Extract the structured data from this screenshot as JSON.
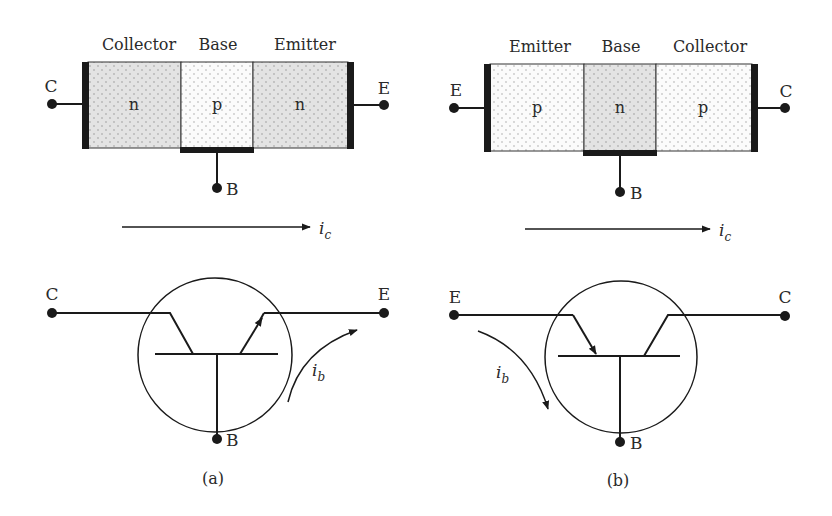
{
  "figure": {
    "colors": {
      "ink": "#1a1a1a",
      "n_region_fill": "#e3e3e3",
      "p_region_fill": "#fbfbfb",
      "dot_pattern": "#8a8a8a"
    },
    "panels": [
      {
        "id": "a",
        "caption": "(a)",
        "type": "npn",
        "region_headers": [
          "Collector",
          "Base",
          "Emitter"
        ],
        "region_types": [
          "n",
          "p",
          "n"
        ],
        "terminals": {
          "left": "C",
          "right": "E",
          "bottom": "B"
        },
        "collector_current_label": "i",
        "collector_current_sub": "c",
        "base_current_label": "i",
        "base_current_sub": "b",
        "symbol_terminals": {
          "left": "C",
          "right": "E",
          "bottom": "B"
        }
      },
      {
        "id": "b",
        "caption": "(b)",
        "type": "pnp",
        "region_headers": [
          "Emitter",
          "Base",
          "Collector"
        ],
        "region_types": [
          "p",
          "n",
          "p"
        ],
        "terminals": {
          "left": "E",
          "right": "C",
          "bottom": "B"
        },
        "collector_current_label": "i",
        "collector_current_sub": "c",
        "base_current_label": "i",
        "base_current_sub": "b",
        "symbol_terminals": {
          "left": "E",
          "right": "C",
          "bottom": "B"
        }
      }
    ]
  }
}
